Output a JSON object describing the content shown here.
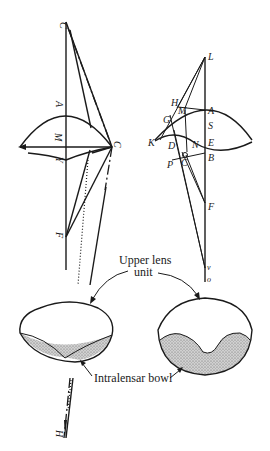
{
  "figure": {
    "left_diagram": {
      "labels": {
        "C_top": "C",
        "A": "A",
        "M": "M",
        "Y": "Y",
        "C_right": "C",
        "F": "F",
        "H": "H"
      }
    },
    "right_diagram": {
      "labels": {
        "L": "L",
        "H": "H",
        "M": "M",
        "A": "A",
        "G": "G",
        "S": "S",
        "K": "K",
        "D": "D",
        "N": "N",
        "E": "E",
        "B": "B",
        "P": "P",
        "C": "C",
        "F": "F",
        "v": "v",
        "o": "o"
      }
    },
    "captions": {
      "upper_lens_line1": "Upper lens",
      "upper_lens_line2": "unit",
      "intralensar_bowl": "Intralensar bowl"
    },
    "colors": {
      "ink": "#1a1a1a",
      "shading": "#bdbdbd",
      "background": "#ffffff"
    }
  }
}
